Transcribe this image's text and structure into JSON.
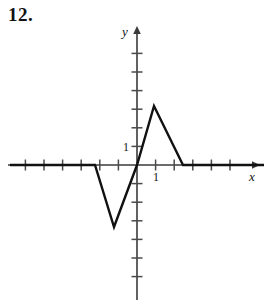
{
  "problem": {
    "number": "12."
  },
  "chart_data": {
    "type": "line",
    "title": "",
    "xlabel": "x",
    "ylabel": "y",
    "grid": false,
    "legend": null,
    "axis_color": "#3a3a3a",
    "curve_color": "#111111",
    "origin_px": {
      "x": 137,
      "y": 165
    },
    "unit_px": {
      "x": 18.6,
      "y": 18.6
    },
    "xlim": [
      -7.2,
      6.8
    ],
    "ylim": [
      -7.3,
      7.2
    ],
    "x_tick_labels": [
      {
        "value": 1,
        "text": "1"
      }
    ],
    "y_tick_labels": [
      {
        "value": 1,
        "text": "1"
      }
    ],
    "x_ticks": [
      -6,
      -5,
      -4,
      -3,
      -2,
      -1,
      1,
      2,
      3,
      4,
      5
    ],
    "y_ticks": [
      -6,
      -5,
      -4,
      -3,
      -2,
      -1,
      1,
      2,
      3,
      4,
      5,
      6
    ],
    "series": [
      {
        "name": "piecewise-linear-wave",
        "points": [
          {
            "x": -6.8,
            "y": 0
          },
          {
            "x": -2.26,
            "y": 0
          },
          {
            "x": -1.24,
            "y": -3.33
          },
          {
            "x": 0,
            "y": 0
          },
          {
            "x": 0.91,
            "y": 3.17
          },
          {
            "x": 2.47,
            "y": 0
          },
          {
            "x": 6.8,
            "y": 0
          }
        ],
        "points_px": [
          {
            "x": 10,
            "y": 165
          },
          {
            "x": 95,
            "y": 165
          },
          {
            "x": 114,
            "y": 227
          },
          {
            "x": 137,
            "y": 165
          },
          {
            "x": 154,
            "y": 106
          },
          {
            "x": 183,
            "y": 165
          },
          {
            "x": 264,
            "y": 165
          }
        ]
      }
    ],
    "annotations": []
  }
}
